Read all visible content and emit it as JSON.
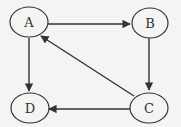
{
  "diagram": {
    "type": "directed-graph",
    "nodes": [
      {
        "id": "A",
        "label": "A",
        "cx": 29,
        "cy": 22
      },
      {
        "id": "B",
        "label": "B",
        "cx": 150,
        "cy": 22
      },
      {
        "id": "C",
        "label": "C",
        "cx": 149,
        "cy": 106
      },
      {
        "id": "D",
        "label": "D",
        "cx": 30,
        "cy": 106
      }
    ],
    "edges": [
      {
        "from": "A",
        "to": "B"
      },
      {
        "from": "B",
        "to": "C"
      },
      {
        "from": "C",
        "to": "A"
      },
      {
        "from": "A",
        "to": "D"
      },
      {
        "from": "C",
        "to": "D"
      }
    ],
    "colors": {
      "stroke": "#333333",
      "background": "#f4f4f2",
      "node_fill": "#f4f4f2"
    }
  }
}
